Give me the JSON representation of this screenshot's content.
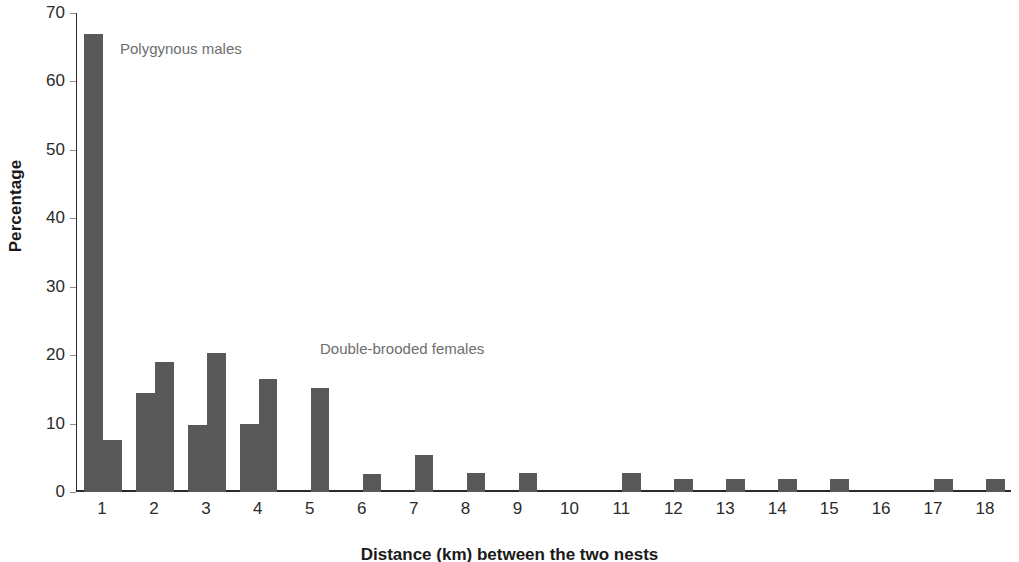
{
  "chart_data": {
    "type": "bar",
    "title": "",
    "subtitle": "",
    "xlabel": "Distance (km) between the two nests",
    "ylabel": "Percentage",
    "categories": [
      "1",
      "2",
      "3",
      "4",
      "5",
      "6",
      "7",
      "8",
      "9",
      "10",
      "11",
      "12",
      "13",
      "14",
      "15",
      "16",
      "17",
      "18"
    ],
    "ylim": [
      0,
      70
    ],
    "yticks": [
      0,
      10,
      20,
      30,
      40,
      50,
      60,
      70
    ],
    "grid": false,
    "legend_position": "inline-annotation",
    "bar_color": "#595959",
    "series": [
      {
        "name": "Polygynous males",
        "values": [
          67.0,
          14.4,
          9.8,
          10.0,
          0,
          0,
          0,
          0,
          0,
          0,
          0,
          0,
          0,
          0,
          0,
          0,
          0,
          0
        ]
      },
      {
        "name": "Double-brooded females",
        "values": [
          7.6,
          19.0,
          20.3,
          16.5,
          15.2,
          2.7,
          5.4,
          2.8,
          2.8,
          0,
          2.8,
          1.9,
          1.9,
          1.9,
          1.9,
          0,
          1.9,
          1.9
        ]
      }
    ],
    "annotations": [
      {
        "text": "Polygynous males",
        "series": "Polygynous males"
      },
      {
        "text": "Double-brooded females",
        "series": "Double-brooded females"
      }
    ]
  }
}
